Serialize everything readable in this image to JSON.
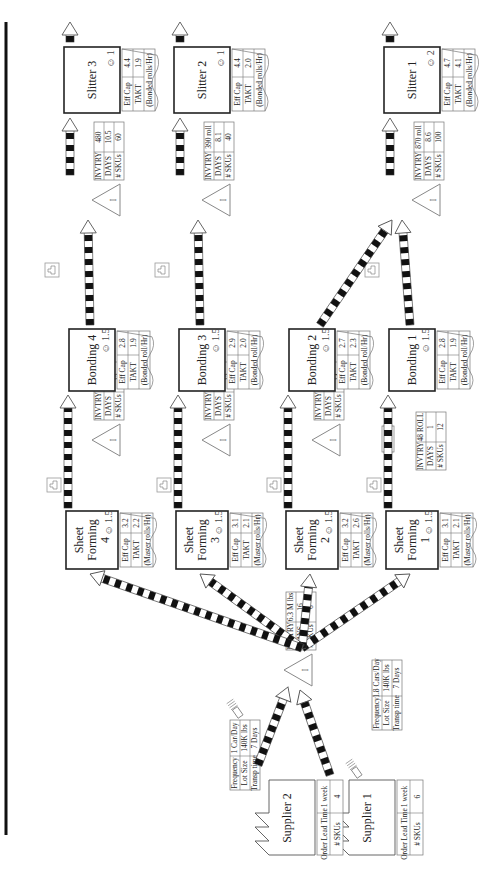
{
  "diagram_type": "value_stream_map",
  "orientation": "rotated-90-ccw",
  "colors": {
    "line": "#222222",
    "table_border": "#777777",
    "background": "#ffffff"
  },
  "suppliers": [
    {
      "name": "Supplier 1",
      "order_lead_time_label": "Order Lead Time",
      "order_lead_time": "1 week",
      "skus_label": "# SKUs",
      "skus": "6",
      "shipment": {
        "frequency_label": "Frequency",
        "frequency": "1.8 Cars/Day",
        "lot_size_label": "Lot Size",
        "lot_size": "140K lbs",
        "transp_label": "Transp time",
        "transp": "7 Days"
      }
    },
    {
      "name": "Supplier 2",
      "order_lead_time_label": "Order Lead Time",
      "order_lead_time": "1 week",
      "skus_label": "# SKUs",
      "skus": "4",
      "shipment": {
        "frequency_label": "Frequency",
        "frequency": "1 Car/Day",
        "lot_size_label": "Lot Size",
        "lot_size": "140K lbs",
        "transp_label": "Transp time",
        "transp": "7 Days"
      }
    }
  ],
  "raw_inventory": {
    "invtry_label": "INVTRY",
    "invtry": "6.3 M lbs",
    "days_label": "DAYS",
    "days": "16",
    "skus_label": "# SKUs",
    "skus": "6"
  },
  "sheet_forming": [
    {
      "name_line1": "Sheet",
      "name_line2": "Forming",
      "name_line3": "1",
      "operators": "1.5",
      "eff_cap": "3.1",
      "takt": "2.1",
      "unit": "(Master rolls/Hr)"
    },
    {
      "name_line1": "Sheet",
      "name_line2": "Forming",
      "name_line3": "2",
      "operators": "1.5",
      "eff_cap": "3.2",
      "takt": "2.6",
      "unit": "(Master rolls/Hr)"
    },
    {
      "name_line1": "Sheet",
      "name_line2": "Forming",
      "name_line3": "3",
      "operators": "1.5",
      "eff_cap": "3.1",
      "takt": "2.1",
      "unit": "(Master rolls/Hr)"
    },
    {
      "name_line1": "Sheet",
      "name_line2": "Forming",
      "name_line3": "4",
      "operators": "1.5",
      "eff_cap": "3.2",
      "takt": "2.2",
      "unit": "(Master rolls/Hr)"
    }
  ],
  "mid_inventory": [
    {
      "fifo_label": "FIFO",
      "invtry": "48 ROLL",
      "days": "1",
      "skus": "12"
    },
    {
      "invtry": "500 roll",
      "days": "8",
      "skus": "14"
    },
    {
      "invtry": "440 roll",
      "days": "8.7",
      "skus": "12"
    },
    {
      "invtry": "500 roll",
      "days": "9.5",
      "skus": "12"
    }
  ],
  "bonding": [
    {
      "name": "Bonding 1",
      "operators": "1.5",
      "eff_cap": "2.8",
      "takt": "1.9",
      "unit": "(Bonded roll/Hr)"
    },
    {
      "name": "Bonding 2",
      "operators": "1.5",
      "eff_cap": "2.7",
      "takt": "2.3",
      "unit": "(Bonded roll/Hr)"
    },
    {
      "name": "Bonding 3",
      "operators": "1.5",
      "eff_cap": "2.9",
      "takt": "2.0",
      "unit": "(Bonded roll/Hr)"
    },
    {
      "name": "Bonding 4",
      "operators": "1.5",
      "eff_cap": "2.8",
      "takt": "1.9",
      "unit": "(Bonded roll/Hr)"
    }
  ],
  "post_bonding_inventory": [
    {
      "invtry": "870 roll",
      "days": "8.6",
      "skus": "100"
    },
    {
      "invtry": "390 roll",
      "days": "8.1",
      "skus": "40"
    },
    {
      "invtry": "480",
      "days": "10.5",
      "skus": "60"
    }
  ],
  "slitters": [
    {
      "name": "Slitter 1",
      "operators": "2",
      "eff_cap": "4.7",
      "takt": "4.1",
      "unit": "(Bonded rolls/Hr)"
    },
    {
      "name": "Slitter 2",
      "operators": "1",
      "eff_cap": "4.4",
      "takt": "2.0",
      "unit": "(Bonded rolls/Hr)"
    },
    {
      "name": "Slitter 3",
      "operators": "1",
      "eff_cap": "4.4",
      "takt": "1.9",
      "unit": "(Bonded rolls/Hr)"
    }
  ],
  "labels": {
    "eff_cap": "Eff Cap",
    "takt": "TAKT",
    "invtry": "INVTRY",
    "days": "DAYS",
    "skus": "# SKUs",
    "inventory_glyph": "I",
    "operator_glyph": "☺"
  }
}
